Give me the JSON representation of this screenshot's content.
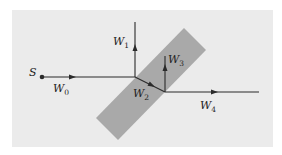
{
  "diagram": {
    "title": "",
    "colors": {
      "background": "#ffffff",
      "panel": "#ebebeb",
      "slab": "#a9a9a9",
      "line": "#2a2a2a"
    },
    "source": {
      "label": "S"
    },
    "waves": [
      {
        "id": "W0",
        "base": "W",
        "sub": "0"
      },
      {
        "id": "W1",
        "base": "W",
        "sub": "1"
      },
      {
        "id": "W2",
        "base": "W",
        "sub": "2"
      },
      {
        "id": "W3",
        "base": "W",
        "sub": "3"
      },
      {
        "id": "W4",
        "base": "W",
        "sub": "4"
      }
    ]
  }
}
